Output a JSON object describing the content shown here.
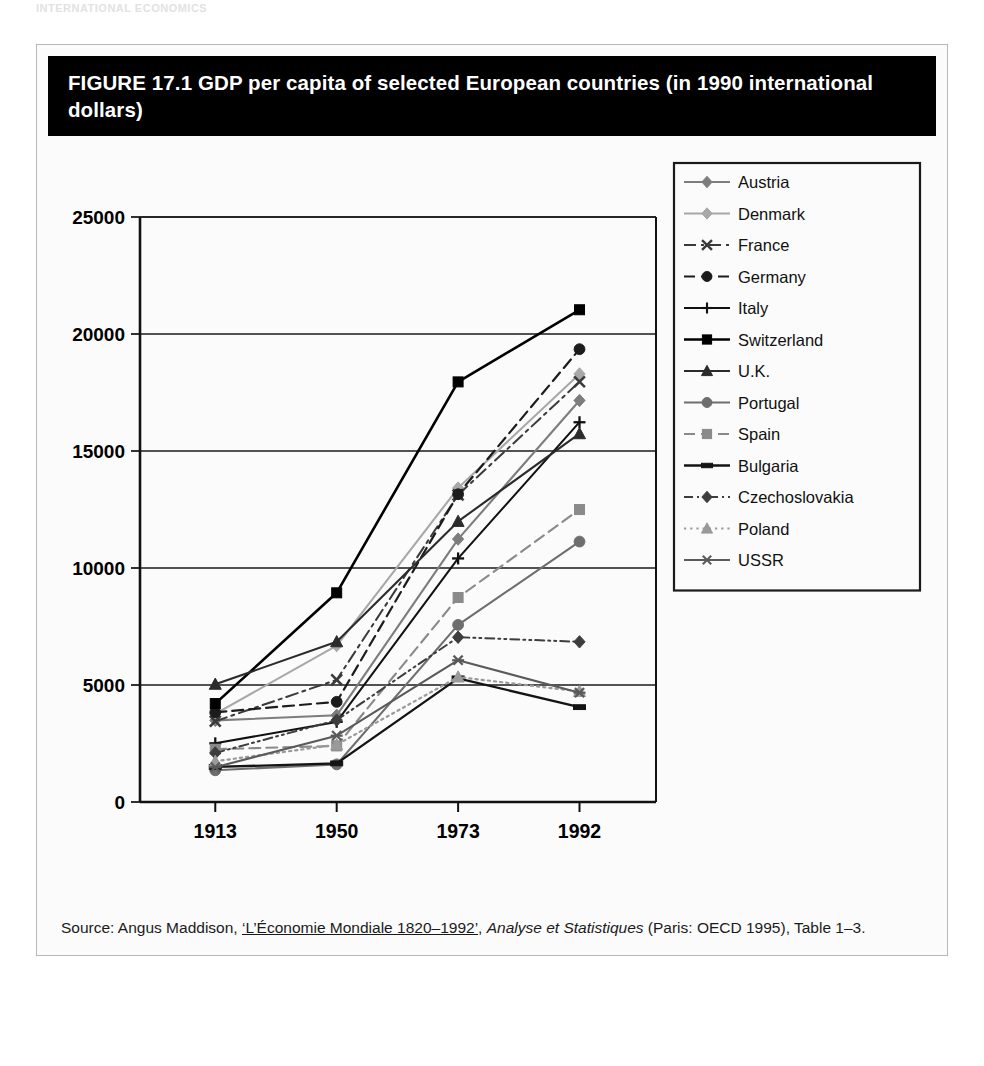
{
  "page": {
    "ghost_top_text": "INTERNATIONAL ECONOMICS"
  },
  "figure": {
    "title": "FIGURE 17.1  GDP per capita of selected European countries (in 1990 international dollars)",
    "source_prefix": "Source: Angus Maddison, ",
    "source_work": "‘L’Économie Mondiale 1820–1992’",
    "source_mid": ", ",
    "source_italic": "Analyse et Statistiques",
    "source_suffix": " (Paris: OECD 1995), Table 1–3."
  },
  "chart_data": {
    "type": "line",
    "title": "GDP per capita of selected European countries (in 1990 international dollars)",
    "xlabel": "",
    "ylabel": "",
    "x": [
      "1913",
      "1950",
      "1973",
      "1992"
    ],
    "categories": [
      "1913",
      "1950",
      "1973",
      "1992"
    ],
    "ylim": [
      0,
      25000
    ],
    "ytick_values": [
      0,
      5000,
      10000,
      15000,
      20000,
      25000
    ],
    "ytick_labels": [
      "0",
      "5000",
      "10000",
      "15000",
      "20000",
      "25000"
    ],
    "grid": "horizontal",
    "legend_position": "right-outside",
    "series": [
      {
        "name": "Austria",
        "values": [
          3488,
          3706,
          11235,
          17160
        ],
        "color": "#7d7d7d",
        "dash": "none",
        "marker": "diamond",
        "width": 2.1
      },
      {
        "name": "Denmark",
        "values": [
          3764,
          6683,
          13416,
          18293
        ],
        "color": "#a8a8a8",
        "dash": "none",
        "marker": "diamond",
        "width": 2.1
      },
      {
        "name": "France",
        "values": [
          3452,
          5221,
          13123,
          17959
        ],
        "color": "#3a3a3a",
        "dash": "dashdot",
        "marker": "cross",
        "width": 2.0
      },
      {
        "name": "Germany",
        "values": [
          3833,
          4281,
          13152,
          19351
        ],
        "color": "#1c1c1c",
        "dash": "dash",
        "marker": "circle",
        "width": 2.2
      },
      {
        "name": "Italy",
        "values": [
          2507,
          3425,
          10409,
          16229
        ],
        "color": "#111111",
        "dash": "none",
        "marker": "plus",
        "width": 2.0
      },
      {
        "name": "Switzerland",
        "values": [
          4207,
          8939,
          17953,
          21036
        ],
        "color": "#000000",
        "dash": "none",
        "marker": "square",
        "width": 2.6
      },
      {
        "name": "U.K.",
        "values": [
          5032,
          6847,
          11992,
          15738
        ],
        "color": "#2b2b2b",
        "dash": "none",
        "marker": "triangle",
        "width": 2.1
      },
      {
        "name": "Portugal",
        "values": [
          1354,
          1608,
          7568,
          11130
        ],
        "color": "#6e6e6e",
        "dash": "none",
        "marker": "circle",
        "width": 2.1
      },
      {
        "name": "Spain",
        "values": [
          2255,
          2397,
          8739,
          12498
        ],
        "color": "#8a8a8a",
        "dash": "dash",
        "marker": "square",
        "width": 2.1
      },
      {
        "name": "Bulgaria",
        "values": [
          1498,
          1651,
          5284,
          4054
        ],
        "color": "#141414",
        "dash": "none",
        "marker": "bar",
        "width": 2.3
      },
      {
        "name": "Czechoslovakia",
        "values": [
          2096,
          3501,
          7041,
          6845
        ],
        "color": "#3d3d3d",
        "dash": "dashdotdot",
        "marker": "diamond",
        "width": 2.0
      },
      {
        "name": "Poland",
        "values": [
          1738,
          2447,
          5340,
          4726
        ],
        "color": "#9a9a9a",
        "dash": "dot",
        "marker": "triangle",
        "width": 2.2
      },
      {
        "name": "USSR",
        "values": [
          1488,
          2834,
          6058,
          4671
        ],
        "color": "#5a5a5a",
        "dash": "none",
        "marker": "star",
        "width": 2.1
      }
    ]
  }
}
